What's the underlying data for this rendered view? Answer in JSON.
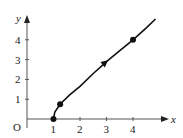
{
  "chart_data": {
    "type": "line",
    "title": "",
    "xlabel": "x",
    "ylabel": "y",
    "origin_label": "O",
    "xlim": [
      0,
      5.4
    ],
    "ylim": [
      0,
      5.3
    ],
    "grid": false,
    "legend": null,
    "x_ticks": [
      1,
      2,
      3,
      4
    ],
    "y_ticks": [
      1,
      2,
      3,
      4
    ],
    "x_tick_labels": [
      "1",
      "2",
      "3",
      "4"
    ],
    "y_tick_labels": [
      "1",
      "2",
      "3",
      "4"
    ],
    "series": [
      {
        "name": "curve",
        "x": [
          1,
          1.05,
          1.25,
          1.6,
          2,
          2.5,
          3,
          3.5,
          4,
          4.5,
          4.85
        ],
        "y": [
          0,
          0.35,
          0.75,
          1.2,
          1.65,
          2.3,
          2.9,
          3.45,
          4.0,
          4.6,
          5.05
        ],
        "color": "#111111",
        "direction_arrow_at": [
          3,
          2.9
        ]
      }
    ],
    "marked_points": [
      {
        "x": 1,
        "y": 0
      },
      {
        "x": 1.25,
        "y": 0.75
      },
      {
        "x": 4,
        "y": 4
      }
    ]
  },
  "axis_color": "#555555",
  "curve_color": "#111111"
}
